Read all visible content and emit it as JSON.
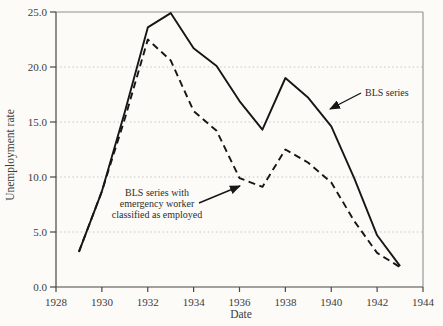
{
  "figure": {
    "background_color": "#fcfbf8",
    "line_color": "#161614",
    "grid_color": "#c6c6c2",
    "axis_color": "#474744",
    "frame_color": "#8f8f8c",
    "text_color": "#3c3c38"
  },
  "chart_data": {
    "type": "line",
    "title": "",
    "xlabel": "Date",
    "ylabel": "Unemployment rate",
    "xlim": [
      1928,
      1944
    ],
    "ylim": [
      0,
      25
    ],
    "grid": "horizontal-dotted",
    "grid_lines_at": [
      5,
      10,
      15,
      20
    ],
    "x_tick_values": [
      1928,
      1930,
      1932,
      1934,
      1936,
      1938,
      1940,
      1942,
      1944
    ],
    "x_tick_labels": [
      "1928",
      "1930",
      "1932",
      "1934",
      "1936",
      "1938",
      "1940",
      "1942",
      "1944"
    ],
    "y_tick_values": [
      0,
      5,
      10,
      15,
      20,
      25
    ],
    "y_tick_labels": [
      "0.0",
      "5.0",
      "10.0",
      "15.0",
      "20.0",
      "25.0"
    ],
    "x": [
      1929,
      1930,
      1931,
      1932,
      1933,
      1934,
      1935,
      1936,
      1937,
      1938,
      1939,
      1940,
      1941,
      1942,
      1943
    ],
    "series": [
      {
        "name": "BLS series",
        "line_style": "solid",
        "color": "#161614",
        "values": [
          3.2,
          8.7,
          15.9,
          23.6,
          24.9,
          21.7,
          20.1,
          16.9,
          14.3,
          19.0,
          17.2,
          14.6,
          9.9,
          4.7,
          1.9
        ]
      },
      {
        "name": "BLS series with emergency worker classified as employed",
        "line_style": "dashed",
        "color": "#161614",
        "values": [
          3.2,
          8.7,
          15.3,
          22.5,
          20.6,
          16.0,
          14.2,
          9.9,
          9.1,
          12.5,
          11.3,
          9.5,
          6.0,
          3.1,
          1.8
        ]
      }
    ],
    "annotations": [
      {
        "lines": [
          "BLS series"
        ],
        "points_to_series": "BLS series"
      },
      {
        "lines": [
          "BLS series with",
          "emergency worker",
          "classified as employed"
        ],
        "points_to_series": "BLS series with emergency worker classified as employed"
      }
    ],
    "legend_position": "none"
  }
}
